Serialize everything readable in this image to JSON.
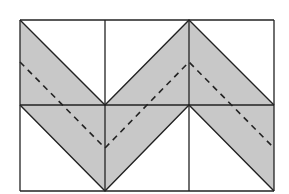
{
  "diagram": {
    "grid": {
      "rows": 2,
      "cols": 3,
      "x_lines": [
        20,
        105,
        189,
        274
      ],
      "y_lines": [
        20,
        105,
        191
      ]
    },
    "band_upper_edge": [
      [
        20,
        20
      ],
      [
        105,
        105
      ],
      [
        189,
        20
      ],
      [
        274,
        105
      ]
    ],
    "band_lower_edge": [
      [
        20,
        105
      ],
      [
        105,
        191
      ],
      [
        189,
        105
      ],
      [
        274,
        191
      ]
    ],
    "dashed_line": [
      [
        20,
        62
      ],
      [
        105,
        148
      ],
      [
        189,
        62
      ],
      [
        274,
        148
      ]
    ],
    "colors": {
      "background": "#ffffff",
      "band_fill": "#c8c8c8",
      "line": "#222222",
      "dashed": "#222222"
    }
  }
}
